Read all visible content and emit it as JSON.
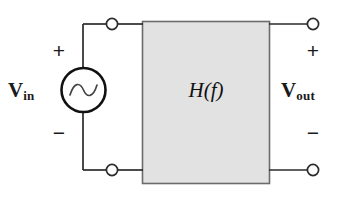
{
  "diagram": {
    "type": "circuit-schematic",
    "background_color": "#ffffff",
    "wire_color": "#2b2b2b",
    "block_fill_color": "#e2e2e2",
    "block_border_color": "#6b6b6b",
    "source": {
      "kind": "ac-voltage-source",
      "symbol": "sine-wave",
      "plus_sign": "+",
      "minus_sign": "−",
      "label_main": "V",
      "label_sub": "in"
    },
    "block": {
      "label": "H(f)"
    },
    "output": {
      "plus_sign": "+",
      "minus_sign": "−",
      "label_main": "V",
      "label_sub": "out"
    },
    "terminals": [
      {
        "name": "input-top",
        "x": 112,
        "y": 24
      },
      {
        "name": "input-bottom",
        "x": 112,
        "y": 170
      },
      {
        "name": "output-top",
        "x": 313,
        "y": 24
      },
      {
        "name": "output-bottom",
        "x": 313,
        "y": 170
      }
    ]
  }
}
